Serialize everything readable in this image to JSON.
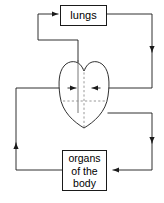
{
  "diagram": {
    "nodes": {
      "lungs": {
        "label": "lungs"
      },
      "heart": {
        "label": "heart-outline",
        "shape": "heart"
      },
      "organs": {
        "lines": [
          "organs",
          "of the",
          "body"
        ]
      }
    },
    "flows": [
      {
        "name": "heart-to-lungs",
        "from": "heart",
        "to": "lungs",
        "direction": "right"
      },
      {
        "name": "lungs-to-heart",
        "from": "lungs",
        "to": "heart",
        "direction": "left"
      },
      {
        "name": "heart-to-organs",
        "from": "heart",
        "to": "organs",
        "direction": "left"
      },
      {
        "name": "organs-to-heart",
        "from": "organs",
        "to": "heart",
        "direction": "up"
      }
    ],
    "colors": {
      "stroke": "#1a1a1a",
      "dashed": "#8c8c8c",
      "background": "#ffffff",
      "text": "#000000"
    }
  }
}
